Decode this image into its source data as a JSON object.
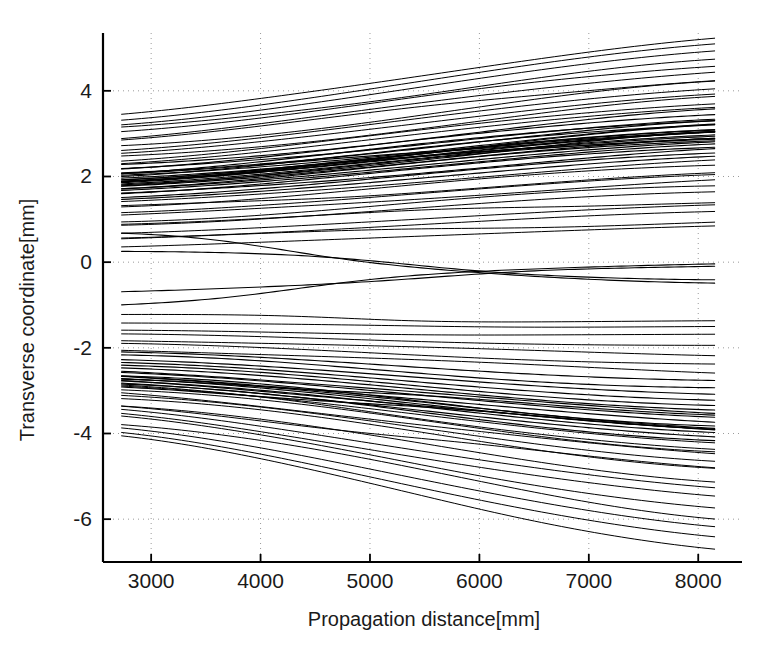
{
  "chart_data": {
    "type": "line",
    "title": "",
    "subtitle": "",
    "xlabel": "Propagation distance[mm]",
    "ylabel": "Transverse coordinate[mm]",
    "xlim": [
      2560,
      8400
    ],
    "ylim": [
      -7.0,
      5.35
    ],
    "xticks": [
      3000,
      4000,
      5000,
      6000,
      7000,
      8000
    ],
    "yticks": [
      4,
      2,
      0,
      -2,
      -4,
      -6
    ],
    "xtick_labels": [
      "3000",
      "4000",
      "5000",
      "6000",
      "7000",
      "8000"
    ],
    "ytick_labels": [
      "4",
      "2",
      "0",
      "-2",
      "-4",
      "-6"
    ],
    "grid": true,
    "grid_style": "dotted",
    "legend": "none",
    "line_color": "#000000",
    "line_width": 1.0,
    "x_data_start": 2730,
    "x_data_end": 8150,
    "n_traces": 96,
    "series": [
      {
        "name": "upper-fan",
        "y_start_range": [
          0.35,
          3.42
        ],
        "y_end_range": [
          1.15,
          4.92
        ],
        "count": 52
      },
      {
        "name": "near-axis",
        "y_start_range": [
          -0.78,
          0.42
        ],
        "y_end_range": [
          -0.25,
          -0.18
        ],
        "count": 4
      },
      {
        "name": "lower-fan",
        "y_start_range": [
          -4.12,
          -1.35
        ],
        "y_end_range": [
          -6.3,
          -1.48
        ],
        "count": 40
      }
    ]
  },
  "axes": {
    "x_axis_name": "propagation-distance-axis",
    "y_axis_name": "transverse-coordinate-axis"
  }
}
